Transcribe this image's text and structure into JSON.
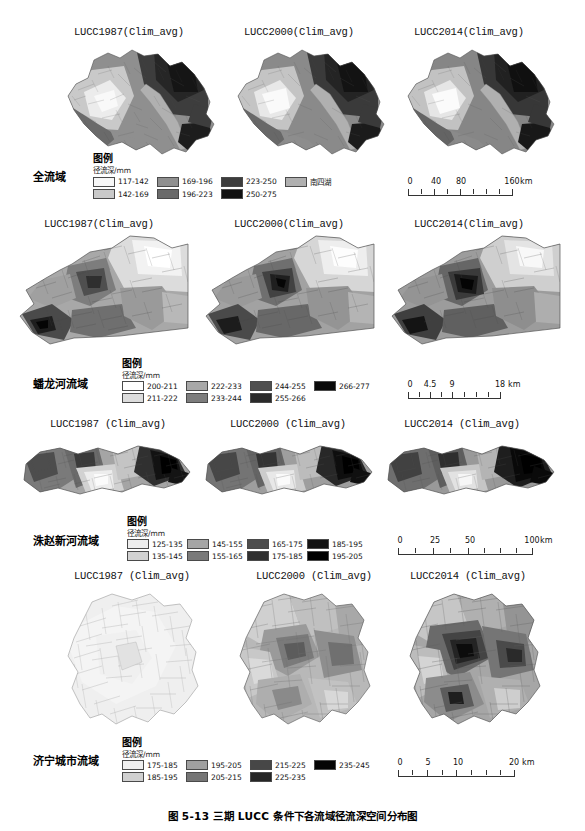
{
  "figure": {
    "caption": "图 5-13  三期 LUCC 条件下各流域径流深空间分布图",
    "legend_heading": "图例",
    "legend_subheading": "径流深/mm"
  },
  "rows": [
    {
      "basin_label": "全流域",
      "titles": [
        "LUCC1987(Clim_avg)",
        "LUCC2000(Clim_avg)",
        "LUCC2014(Clim_avg)"
      ],
      "legend": {
        "heading": "图例",
        "subheading": "径流深/mm",
        "classes": [
          {
            "label": "117-142",
            "color": "#f7f7f7"
          },
          {
            "label": "142-169",
            "color": "#c9c9c9"
          },
          {
            "label": "169-196",
            "color": "#8f8f8f"
          },
          {
            "label": "196-223",
            "color": "#6a6a6a"
          },
          {
            "label": "223-250",
            "color": "#3d3d3d"
          },
          {
            "label": "250-275",
            "color": "#111111"
          },
          {
            "label": "南四湖",
            "color": "#b0b0b0"
          }
        ]
      },
      "scalebar": {
        "labels": [
          "0",
          "40",
          "80",
          "160"
        ],
        "unit": "km",
        "positions": [
          0,
          22,
          42,
          88
        ],
        "ticks": 8
      }
    },
    {
      "basin_label": "蟠龙河流域",
      "titles": [
        "LUCC1987(Clim_avg)",
        "LUCC2000(Clim_avg)",
        "LUCC2014(Clim_avg)"
      ],
      "legend": {
        "heading": "图例",
        "subheading": "径流深/mm",
        "classes": [
          {
            "label": "200-211",
            "color": "#ffffff"
          },
          {
            "label": "211-222",
            "color": "#dcdcdc"
          },
          {
            "label": "222-233",
            "color": "#a8a8a8"
          },
          {
            "label": "233-244",
            "color": "#7d7d7d"
          },
          {
            "label": "244-255",
            "color": "#4f4f4f"
          },
          {
            "label": "255-266",
            "color": "#2a2a2a"
          },
          {
            "label": "266-277",
            "color": "#0a0a0a"
          }
        ]
      },
      "scalebar": {
        "labels": [
          "0",
          "4.5",
          "9",
          "18"
        ],
        "unit": "km",
        "positions": [
          0,
          18,
          38,
          82
        ],
        "ticks": 8
      }
    },
    {
      "basin_label": "洙赵新河流域",
      "titles": [
        "LUCC1987 (Clim_avg)",
        "LUCC2000 (Clim_avg)",
        "LUCC2014 (Clim_avg)"
      ],
      "legend": {
        "heading": "图例",
        "subheading": "径流深/mm",
        "classes": [
          {
            "label": "125-135",
            "color": "#ededed"
          },
          {
            "label": "135-145",
            "color": "#d2d2d2"
          },
          {
            "label": "145-155",
            "color": "#a5a5a5"
          },
          {
            "label": "155-165",
            "color": "#7a7a7a"
          },
          {
            "label": "165-175",
            "color": "#4d4d4d"
          },
          {
            "label": "175-185",
            "color": "#303030"
          },
          {
            "label": "185-195",
            "color": "#141414"
          },
          {
            "label": "195-205",
            "color": "#000000"
          }
        ]
      },
      "scalebar": {
        "labels": [
          "0",
          "25",
          "50",
          "100"
        ],
        "unit": "km",
        "positions": [
          0,
          25,
          50,
          100
        ],
        "ticks": 8
      }
    },
    {
      "basin_label": "济宁城市流域",
      "titles": [
        "LUCC1987 (Clim_avg)",
        "LUCC2000 (Clim_avg)",
        "LUCC2014 (Clim_avg)"
      ],
      "legend": {
        "heading": "图例",
        "subheading": "径流深/mm",
        "classes": [
          {
            "label": "175-185",
            "color": "#efefef"
          },
          {
            "label": "185-195",
            "color": "#d0d0d0"
          },
          {
            "label": "195-205",
            "color": "#a0a0a0"
          },
          {
            "label": "205-215",
            "color": "#757575"
          },
          {
            "label": "215-225",
            "color": "#474747"
          },
          {
            "label": "225-235",
            "color": "#262626"
          },
          {
            "label": "235-245",
            "color": "#050505"
          }
        ]
      },
      "scalebar": {
        "labels": [
          "0",
          "5",
          "10",
          "20"
        ],
        "unit": "km",
        "positions": [
          0,
          22,
          44,
          88
        ],
        "ticks": 8
      }
    }
  ]
}
